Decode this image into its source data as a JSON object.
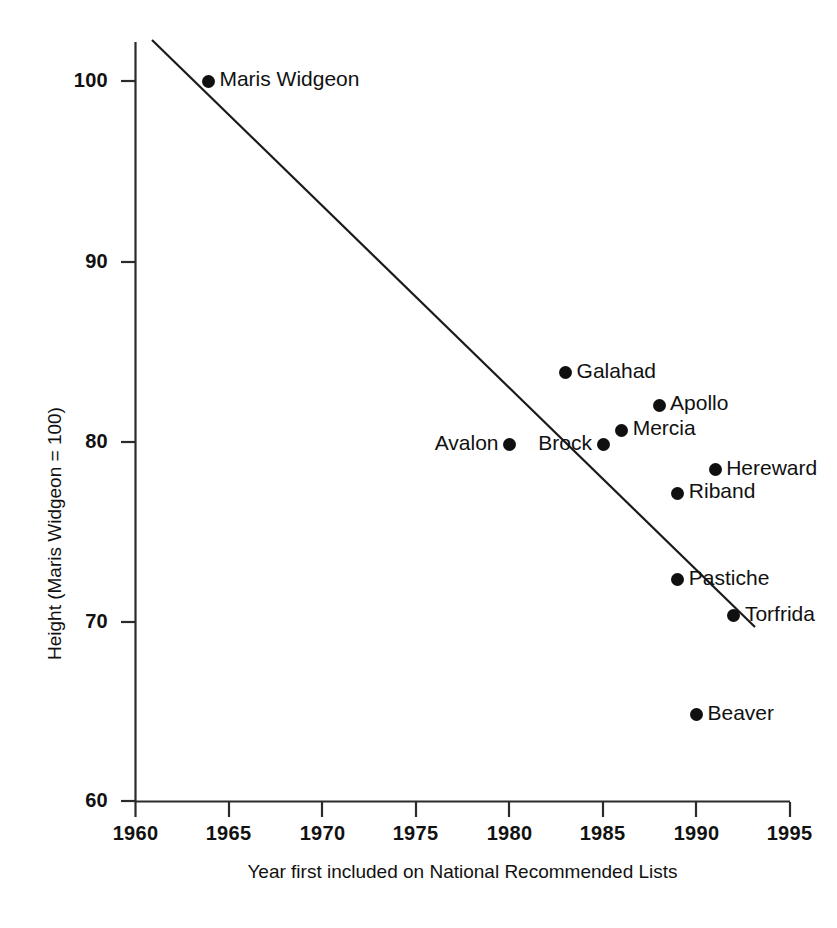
{
  "chart_data": {
    "type": "scatter",
    "title": "",
    "xlabel": "Year first included on National Recommended Lists",
    "ylabel": "Height (Maris Widgeon = 100)",
    "xlim": [
      1960,
      1995
    ],
    "ylim": [
      60,
      102.3
    ],
    "xticks": [
      1960,
      1965,
      1970,
      1975,
      1980,
      1985,
      1990,
      1995
    ],
    "yticks": [
      60,
      70,
      80,
      90,
      100
    ],
    "grid": false,
    "legend": "none",
    "point_color": "#101010",
    "line_color": "#1a1a1a",
    "points": [
      {
        "label": "Maris Widgeon",
        "x": 1963.9,
        "y": 100.0,
        "label_side": "right"
      },
      {
        "label": "Galahad",
        "x": 1983.0,
        "y": 83.8,
        "label_side": "right"
      },
      {
        "label": "Apollo",
        "x": 1988.0,
        "y": 82.0,
        "label_side": "right"
      },
      {
        "label": "Mercia",
        "x": 1986.0,
        "y": 80.6,
        "label_side": "right"
      },
      {
        "label": "Avalon",
        "x": 1980.0,
        "y": 79.8,
        "label_side": "left"
      },
      {
        "label": "Brock",
        "x": 1985.0,
        "y": 79.8,
        "label_side": "left"
      },
      {
        "label": "Hereward",
        "x": 1991.0,
        "y": 78.4,
        "label_side": "right"
      },
      {
        "label": "Riband",
        "x": 1989.0,
        "y": 77.1,
        "label_side": "right"
      },
      {
        "label": "Pastiche",
        "x": 1989.0,
        "y": 72.3,
        "label_side": "right"
      },
      {
        "label": "Torfrida",
        "x": 1992.0,
        "y": 70.3,
        "label_side": "right"
      },
      {
        "label": "Beaver",
        "x": 1990.0,
        "y": 64.8,
        "label_side": "right"
      }
    ],
    "trend_line": {
      "x_start": 1960.9,
      "y_start": 102.3,
      "x_end": 1994.2,
      "y_end": 69.75
    }
  },
  "axes": {
    "x_tick_labels": [
      "1960",
      "1965",
      "1970",
      "1975",
      "1980",
      "1985",
      "1990",
      "1995"
    ],
    "y_tick_labels": [
      "100",
      "90",
      "80",
      "70",
      "60"
    ],
    "x_title": "Year first included on National Recommended Lists",
    "y_title": "Height (Maris Widgeon = 100)"
  }
}
